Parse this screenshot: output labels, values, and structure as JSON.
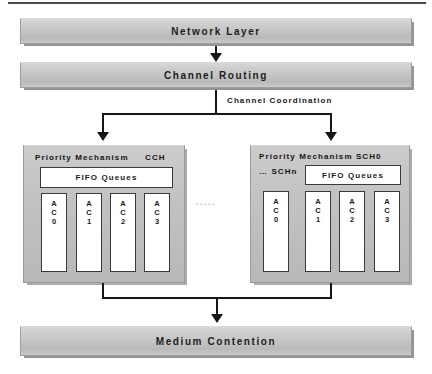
{
  "diagram": {
    "top_rule": true,
    "colors": {
      "bar_fill": "#c4c4c4",
      "panel_fill": "#c2c2c2",
      "queue_fill": "#ffffff",
      "line": "#171717",
      "text": "#1a1a1a",
      "ellipsis": "#b4b4b4"
    },
    "layers": {
      "network": {
        "label": "Network Layer"
      },
      "routing": {
        "label": "Channel Routing"
      },
      "medium": {
        "label": "Medium Contention"
      }
    },
    "annotations": {
      "channel_coordination": "Channel Coordination",
      "ellipsis": "....."
    },
    "panels": [
      {
        "id": "cch",
        "title": "Priority Mechanism",
        "channel": "CCH",
        "fifo_label": "FIFO Queues",
        "queues": [
          {
            "l1": "A",
            "l2": "C",
            "l3": "0",
            "name": "AC0"
          },
          {
            "l1": "A",
            "l2": "C",
            "l3": "1",
            "name": "AC1"
          },
          {
            "l1": "A",
            "l2": "C",
            "l3": "2",
            "name": "AC2"
          },
          {
            "l1": "A",
            "l2": "C",
            "l3": "3",
            "name": "AC3"
          }
        ]
      },
      {
        "id": "sch",
        "title": "Priority Mechanism SCH0",
        "channel": "… SCHn",
        "fifo_label": "FIFO Queues",
        "queues": [
          {
            "l1": "A",
            "l2": "C",
            "l3": "0",
            "name": "AC0"
          },
          {
            "l1": "A",
            "l2": "C",
            "l3": "1",
            "name": "AC1"
          },
          {
            "l1": "A",
            "l2": "C",
            "l3": "2",
            "name": "AC2"
          },
          {
            "l1": "A",
            "l2": "C",
            "l3": "3",
            "name": "AC3"
          }
        ]
      }
    ]
  }
}
